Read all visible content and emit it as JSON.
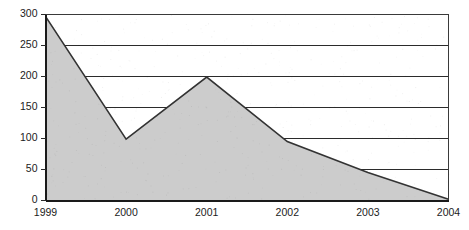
{
  "chart_data": {
    "type": "area",
    "title": "",
    "subtitle": "",
    "xlabel": "",
    "ylabel": "",
    "categories": [
      "1999",
      "2000",
      "2001",
      "2002",
      "2003",
      "2004"
    ],
    "values": [
      297,
      99,
      199,
      95,
      45,
      2
    ],
    "series": [
      {
        "name": "",
        "values": [
          297,
          99,
          199,
          95,
          45,
          2
        ]
      }
    ],
    "xlim": [
      0,
      5
    ],
    "ylim": [
      0,
      300
    ],
    "y_ticks": [
      0,
      50,
      100,
      150,
      200,
      250,
      300
    ],
    "y_tick_labels": [
      "0",
      "50",
      "100",
      "150",
      "200",
      "250",
      "300"
    ],
    "x_tick_labels": [
      "1999",
      "2000",
      "2001",
      "2002",
      "2003",
      "2004"
    ],
    "grid": true,
    "grid_axis": "y",
    "legend": false,
    "legend_position": "none",
    "colors": {
      "area_fill": "#cccccc",
      "area_outline": "#333333",
      "gridline": "#2b2b2b",
      "axis": "#1a1a1a",
      "frame": "#3a3a3a",
      "tick_label": "#1b1b1b",
      "background": "#ffffff"
    }
  }
}
